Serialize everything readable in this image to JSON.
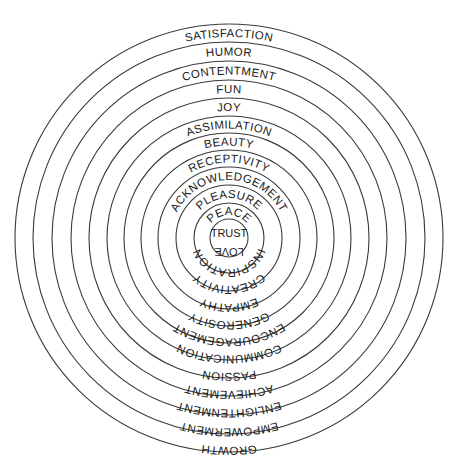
{
  "diagram": {
    "type": "concentric-circles",
    "center": [
      229,
      238
    ],
    "ring_color": "#3a3a3a",
    "text_color": "#1a1a1a",
    "radii": [
      214,
      196,
      177,
      158,
      140,
      122,
      105,
      88,
      71,
      53,
      35,
      19
    ],
    "bands": [
      {
        "top": "SATISFACTION",
        "bottom": "GROWTH"
      },
      {
        "top": "HUMOR",
        "bottom": "EMPOWERMENT"
      },
      {
        "top": "CONTENTMENT",
        "bottom": "ENLIGHTENMENT"
      },
      {
        "top": "FUN",
        "bottom": "ACHIEVEMENT"
      },
      {
        "top": "JOY",
        "bottom": "PASSION"
      },
      {
        "top": "ASSIMILATION",
        "bottom": "COMMUNICATION"
      },
      {
        "top": "BEAUTY",
        "bottom": "ENCOURAGEMENT"
      },
      {
        "top": "RECEPTIVITY",
        "bottom": "GENEROSITY"
      },
      {
        "top": "ACKNOWLEDGEMENT",
        "bottom": "EMPATHY"
      },
      {
        "top": "PLEASURE",
        "bottom": "CREATIVITY"
      },
      {
        "top": "PEACE",
        "bottom": "INSPIRATION"
      }
    ],
    "center_labels": {
      "top": "TRUST",
      "bottom": "LOVE"
    }
  }
}
